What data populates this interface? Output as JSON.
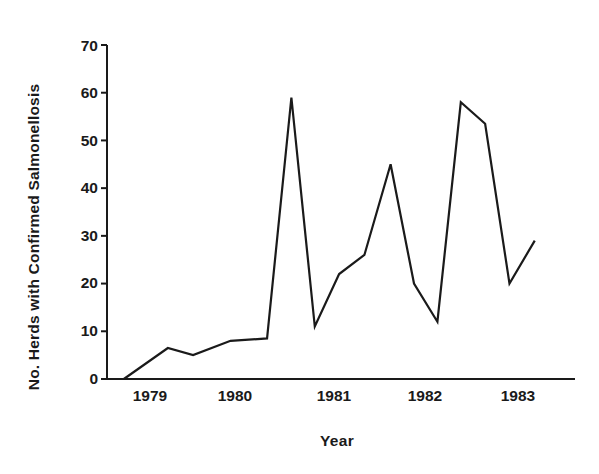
{
  "chart_data": {
    "type": "line",
    "title": "",
    "xlabel": "Year",
    "ylabel": "No. Herds with Confirmed Salmonellosis",
    "xlim": [
      1978.6,
      1983.6
    ],
    "ylim": [
      0,
      70
    ],
    "ytick_labels": [
      "0",
      "10",
      "20",
      "30",
      "40",
      "50",
      "60",
      "70"
    ],
    "ytick_values": [
      0,
      10,
      20,
      30,
      40,
      50,
      60,
      70
    ],
    "xtick_labels": [
      "1979",
      "1980",
      "1981",
      "1982",
      "1983"
    ],
    "xtick_values": [
      1979,
      1980,
      1981,
      1982,
      1983
    ],
    "grid": false,
    "legend": false,
    "line_color": "#1a1a1a",
    "series": [
      {
        "name": "No. Herds with Confirmed Salmonellosis",
        "x": [
          1978.78,
          1979.25,
          1979.52,
          1979.92,
          1980.31,
          1980.57,
          1980.82,
          1981.08,
          1981.35,
          1981.63,
          1981.88,
          1982.13,
          1982.38,
          1982.64,
          1982.9,
          1983.17
        ],
        "values": [
          0,
          6.5,
          5,
          8,
          8.5,
          59,
          11,
          22,
          26,
          45,
          20,
          12,
          58,
          53.5,
          20,
          29
        ]
      }
    ]
  },
  "axis": {
    "y_title": "No. Herds with Confirmed Salmonellosis",
    "x_title": "Year"
  }
}
